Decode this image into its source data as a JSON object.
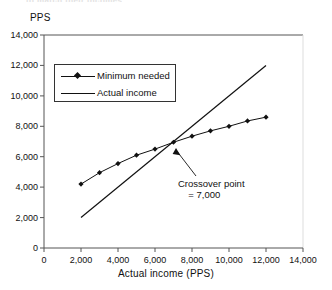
{
  "figure": {
    "cut_off_header": "to match their incomes",
    "ylabel": "PPS",
    "xlabel": "Actual income (PPS)"
  },
  "legend": {
    "entries": [
      {
        "label": "Minimum needed",
        "marker": "diamond-marker",
        "color": "#111111"
      },
      {
        "label": "Actual income",
        "marker": "line-only",
        "color": "#111111"
      }
    ]
  },
  "annotation": {
    "line1": "Crossover point",
    "line2": "= 7,000",
    "arrow": "arrow-up-left"
  },
  "axes": {
    "y_ticks": [
      "0",
      "2,000",
      "4,000",
      "6,000",
      "8,000",
      "10,000",
      "12,000",
      "14,000"
    ],
    "x_ticks": [
      "0",
      "2,000",
      "4,000",
      "6,000",
      "8,000",
      "10,000",
      "12,000",
      "14,000"
    ]
  },
  "chart_data": {
    "type": "line",
    "title": "",
    "subtitle": "",
    "xlabel": "Actual income (PPS)",
    "ylabel": "PPS",
    "xlim": [
      0,
      14000
    ],
    "ylim": [
      0,
      14000
    ],
    "xtick_values": [
      0,
      2000,
      4000,
      6000,
      8000,
      10000,
      12000,
      14000
    ],
    "ytick_values": [
      0,
      2000,
      4000,
      6000,
      8000,
      10000,
      12000,
      14000
    ],
    "grid": false,
    "legend_position": "upper-left-inside",
    "series": [
      {
        "name": "Minimum needed",
        "marker": "diamond",
        "color": "#111111",
        "x": [
          2000,
          3000,
          4000,
          5000,
          6000,
          7000,
          8000,
          9000,
          10000,
          11000,
          12000
        ],
        "values": [
          4200,
          4950,
          5550,
          6100,
          6500,
          6950,
          7350,
          7700,
          8000,
          8350,
          8600
        ]
      },
      {
        "name": "Actual income",
        "marker": "none",
        "color": "#111111",
        "x": [
          2000,
          12000
        ],
        "values": [
          2000,
          12000
        ]
      }
    ],
    "annotations": [
      {
        "text": "Crossover point = 7,000",
        "x": 7000,
        "y": 7000
      }
    ]
  }
}
